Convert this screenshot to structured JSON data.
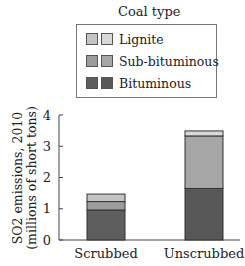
{
  "legend": {
    "title": "Coal type",
    "items": [
      {
        "label": "Lignite",
        "color_scrubbed": "#c4c4c4",
        "color_unscrubbed": "#d8d8d8"
      },
      {
        "label": "Sub-bituminous",
        "color_scrubbed": "#9c9c9c",
        "color_unscrubbed": "#a6a6a6"
      },
      {
        "label": "Bituminous",
        "color_scrubbed": "#5e5e5e",
        "color_unscrubbed": "#585858"
      }
    ]
  },
  "chart_data": {
    "type": "bar",
    "stacked": true,
    "title": "",
    "legend_title": "Coal type",
    "legend_position": "top",
    "categories": [
      "Scrubbed",
      "Unscrubbed"
    ],
    "series": [
      {
        "name": "Bituminous",
        "values": [
          0.96,
          1.65
        ],
        "colors": [
          "#5e5e5e",
          "#585858"
        ]
      },
      {
        "name": "Sub-bituminous",
        "values": [
          0.27,
          1.68
        ],
        "colors": [
          "#9c9c9c",
          "#a6a6a6"
        ]
      },
      {
        "name": "Lignite",
        "values": [
          0.24,
          0.16
        ],
        "colors": [
          "#c4c4c4",
          "#d8d8d8"
        ]
      }
    ],
    "totals": [
      1.47,
      3.49
    ],
    "xlabel": "",
    "ylabel_line1": "SO2 emissions, 2010",
    "ylabel_line2": "(millions of short tons)",
    "ylim": [
      0,
      4
    ],
    "yticks": [
      0,
      1,
      2,
      3,
      4
    ],
    "grid": false
  }
}
